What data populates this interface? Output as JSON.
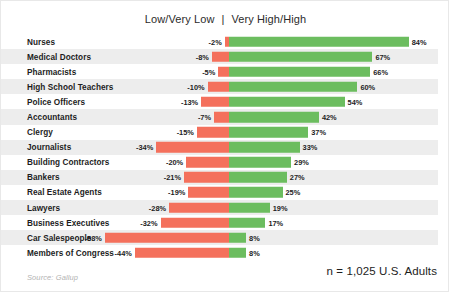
{
  "header": {
    "left_label": "Low/Very Low",
    "divider": "|",
    "right_label": "Very High/High"
  },
  "footer": {
    "source": "Source: Gallup",
    "sample": "n = 1,025 U.S. Adults"
  },
  "colors": {
    "negative_bar": "#f4705c",
    "positive_bar": "#6cbd5f",
    "row_band": "#ededed",
    "background": "#ffffff",
    "text": "#1d1d1d",
    "source_text": "#b3b3b3"
  },
  "chart_data": {
    "type": "bar",
    "orientation": "horizontal",
    "layout": "diverging",
    "title": "",
    "subtitle": "",
    "xlabel": "",
    "ylabel": "",
    "grid": false,
    "legend_position": "top-center",
    "axis_center_percent": 0,
    "xlim": [
      -58,
      84
    ],
    "categories": [
      "Nurses",
      "Medical Doctors",
      "Pharmacists",
      "High School Teachers",
      "Police Officers",
      "Accountants",
      "Clergy",
      "Journalists",
      "Building Contractors",
      "Bankers",
      "Real Estate Agents",
      "Lawyers",
      "Business Executives",
      "Car Salespeople",
      "Members of Congress"
    ],
    "series": [
      {
        "name": "Low/Very Low",
        "color": "#f4705c",
        "values": [
          -2,
          -8,
          -5,
          -10,
          -13,
          -7,
          -15,
          -34,
          -20,
          -21,
          -19,
          -28,
          -32,
          -58,
          -44
        ],
        "labels": [
          "-2%",
          "-8%",
          "-5%",
          "-10%",
          "-13%",
          "-7%",
          "-15%",
          "-34%",
          "-20%",
          "-21%",
          "-19%",
          "-28%",
          "-32%",
          "-58%",
          "-44%"
        ]
      },
      {
        "name": "Very High/High",
        "color": "#6cbd5f",
        "values": [
          84,
          67,
          66,
          60,
          54,
          42,
          37,
          33,
          29,
          27,
          25,
          19,
          17,
          8,
          8
        ],
        "labels": [
          "84%",
          "67%",
          "66%",
          "60%",
          "54%",
          "42%",
          "37%",
          "33%",
          "29%",
          "27%",
          "25%",
          "19%",
          "17%",
          "8%",
          "8%"
        ]
      }
    ],
    "annotations": [
      "n = 1,025 U.S. Adults",
      "Source: Gallup"
    ]
  }
}
